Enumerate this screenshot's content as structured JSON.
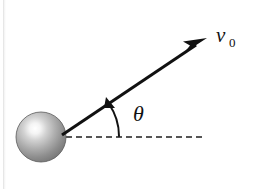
{
  "figure": {
    "background_color": "#ffffff",
    "width": 255,
    "height": 189
  },
  "labels": {
    "velocity": {
      "symbol": "v",
      "subscript": "0",
      "full": "v0",
      "x": 216,
      "y": 42,
      "color": "#111111"
    },
    "angle": {
      "symbol": "θ",
      "name": "theta",
      "x": 133,
      "y": 121,
      "color": "#111111"
    }
  },
  "sphere": {
    "name": "ball",
    "center_x": 41,
    "center_y": 137,
    "radius": 25,
    "highlight_x": 35,
    "highlight_y": 130,
    "highlight_color": "#ffffff",
    "mid_color": "#a8a8a8",
    "edge_color": "#6d6d6d",
    "outline_color": "#5a5a5a"
  },
  "velocity_vector": {
    "name": "velocity-arrow",
    "start_x": 62,
    "start_y": 135,
    "end_x": 207,
    "end_y": 38,
    "stroke_width": 3,
    "color": "#111111",
    "arrowhead_length": 22,
    "arrowhead_half_width": 5
  },
  "horizontal_reference": {
    "name": "horizontal-dashed-line",
    "start_x": 66,
    "end_x": 202,
    "y": 137,
    "dash_length": 6,
    "gap_length": 4,
    "stroke_width": 2,
    "color": "#555555"
  },
  "angle_arc": {
    "name": "angle-arc-arrow",
    "pivot_x": 62,
    "pivot_y": 136,
    "radius": 57,
    "start_angle_deg": 0,
    "end_angle_deg": 34,
    "stroke_width": 2,
    "color": "#111111"
  },
  "colors": {
    "ink": "#111111",
    "dash_gray": "#555555",
    "sphere_light": "#ffffff",
    "sphere_dark": "#6d6d6d",
    "page_white": "#ffffff"
  }
}
